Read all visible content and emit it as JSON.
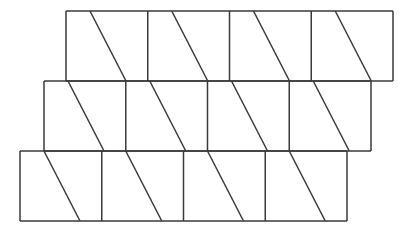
{
  "figure": {
    "type": "geometric-line-figure",
    "canvas": {
      "width": 415,
      "height": 233,
      "background": "#ffffff"
    },
    "stroke": {
      "color": "#3a3a3a",
      "width": 1.5,
      "linecap": "butt"
    },
    "fill": "none",
    "geometry": {
      "band_height": 70,
      "cell_width": 81.75,
      "cells_per_band": 4,
      "diagonal_top_offset": 24,
      "diagonal_bottom_offset": 60,
      "rows": [
        {
          "name": "top-row",
          "x_left": 66,
          "x_right": 393,
          "y_top": 11,
          "y_bottom": 81,
          "dividers_x": [
            147.75,
            229.5,
            311.25
          ],
          "cells": [
            {
              "name": "top-cell-1",
              "x0": 66,
              "x1": 147.75
            },
            {
              "name": "top-cell-2",
              "x0": 147.75,
              "x1": 229.5
            },
            {
              "name": "top-cell-3",
              "x0": 229.5,
              "x1": 311.25
            },
            {
              "name": "top-cell-4",
              "x0": 311.25,
              "x1": 393
            }
          ]
        },
        {
          "name": "middle-row",
          "x_left": 44,
          "x_right": 371,
          "y_top": 81,
          "y_bottom": 151,
          "dividers_x": [
            125.75,
            207.5,
            289.25
          ],
          "cells": [
            {
              "name": "middle-cell-1",
              "x0": 44,
              "x1": 125.75
            },
            {
              "name": "middle-cell-2",
              "x0": 125.75,
              "x1": 207.5
            },
            {
              "name": "middle-cell-3",
              "x0": 207.5,
              "x1": 289.25
            },
            {
              "name": "middle-cell-4",
              "x0": 289.25,
              "x1": 371
            }
          ]
        },
        {
          "name": "bottom-row",
          "x_left": 20,
          "x_right": 347,
          "y_top": 151,
          "y_bottom": 221,
          "dividers_x": [
            101.75,
            183.5,
            265.25
          ],
          "cells": [
            {
              "name": "bottom-cell-1",
              "x0": 20,
              "x1": 101.75
            },
            {
              "name": "bottom-cell-2",
              "x0": 101.75,
              "x1": 183.5
            },
            {
              "name": "bottom-cell-3",
              "x0": 183.5,
              "x1": 265.25
            },
            {
              "name": "bottom-cell-4",
              "x0": 265.25,
              "x1": 347
            }
          ]
        }
      ]
    }
  }
}
